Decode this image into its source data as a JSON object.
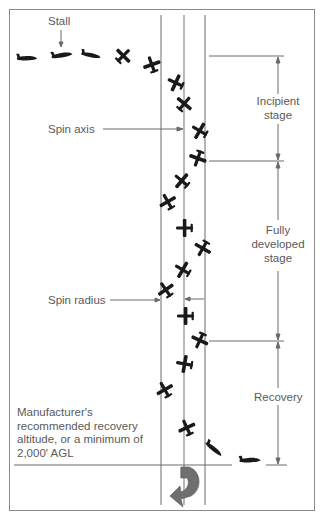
{
  "diagram": {
    "labels": {
      "stall": "Stall",
      "spin_axis": "Spin axis",
      "spin_radius": "Spin radius",
      "incipient_line1": "Incipient",
      "incipient_line2": "stage",
      "fully_line1": "Fully",
      "fully_line2": "developed",
      "fully_line3": "stage",
      "recovery": "Recovery"
    },
    "note": {
      "line1": "Manufacturer's",
      "line2": "recommended recovery",
      "line3": "altitude, or a minimum of",
      "line4": "2,000' AGL"
    },
    "stages": [
      {
        "name": "Incipient stage",
        "top_y": 56,
        "bottom_y": 161
      },
      {
        "name": "Fully developed stage",
        "top_y": 161,
        "bottom_y": 341
      },
      {
        "name": "Recovery",
        "top_y": 341,
        "bottom_y": 465
      }
    ],
    "colors": {
      "line": "#6b6b6b",
      "aircraft": "#1a1a1a",
      "rotation_arrow": "#6f6f6f",
      "text": "#5a5a5a"
    },
    "icons": {
      "aircraft": "airplane-silhouette",
      "rotation": "curved-rotation-arrow"
    }
  }
}
